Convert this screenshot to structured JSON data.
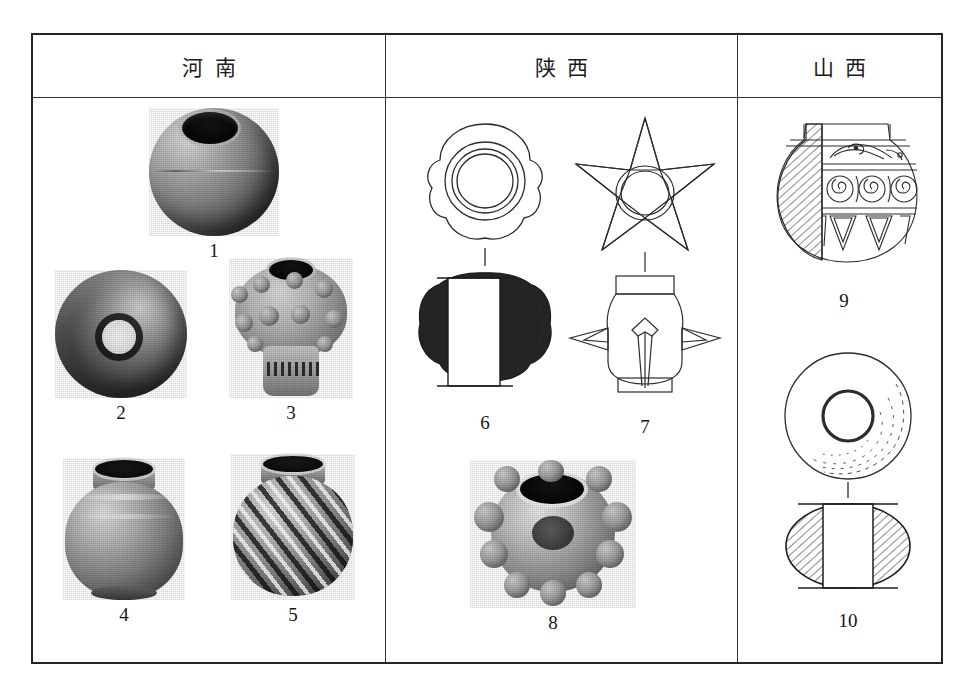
{
  "plate": {
    "columns": [
      {
        "id": "henan",
        "header": "河南",
        "figures": [
          {
            "num": "1",
            "caption": "1",
            "kind": "photo",
            "subject": "spherical-pottery-bead-with-large-mouth"
          },
          {
            "num": "2",
            "caption": "2",
            "kind": "photo",
            "subject": "spherical-bead-with-central-perforation"
          },
          {
            "num": "3",
            "caption": "3",
            "kind": "photo",
            "subject": "knobbed-spiked-bead-with-inked-catalog-mark"
          },
          {
            "num": "4",
            "caption": "4",
            "kind": "photo",
            "subject": "small-ribbed-jar-with-everted-rim"
          },
          {
            "num": "5",
            "caption": "5",
            "kind": "photo",
            "subject": "small-jar-with-spiral-twisted-fluting"
          }
        ]
      },
      {
        "id": "shaanxi",
        "header": "陕西",
        "figures": [
          {
            "num": "6",
            "caption": "6",
            "kind": "drawing",
            "subject": "lobed-bead-plan-and-sectioned-elevation"
          },
          {
            "num": "7",
            "caption": "7",
            "kind": "drawing",
            "subject": "five-pointed-star-spiked-bead-plan-and-elevation"
          },
          {
            "num": "8",
            "caption": "8",
            "kind": "photo",
            "subject": "knobbed-spiked-ball-with-central-opening"
          }
        ]
      },
      {
        "id": "shanxi",
        "header": "山西",
        "figures": [
          {
            "num": "9",
            "caption": "9",
            "kind": "drawing",
            "subject": "decorated-jar-with-hatched-half-section-and-scroll-band"
          },
          {
            "num": "10",
            "caption": "10",
            "kind": "drawing",
            "subject": "annular-bead-plan-and-hatched-section"
          }
        ]
      }
    ]
  },
  "colors": {
    "frame": "#242424",
    "rule": "#333333",
    "ink": "#1a1a1a",
    "page": "#ffffff"
  }
}
